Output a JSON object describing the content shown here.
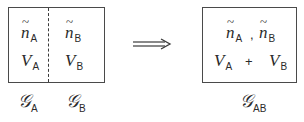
{
  "left_system": {
    "region_A": {
      "density": {
        "symbol": "n",
        "subscript": "A"
      },
      "volume": {
        "symbol": "V",
        "subscript": "A"
      },
      "label": {
        "symbol": "𝒢",
        "subscript": "A"
      }
    },
    "region_B": {
      "density": {
        "symbol": "n",
        "subscript": "B"
      },
      "volume": {
        "symbol": "V",
        "subscript": "B"
      },
      "label": {
        "symbol": "𝒢",
        "subscript": "B"
      }
    }
  },
  "arrow": {
    "type": "double-arrow",
    "direction": "right"
  },
  "right_system": {
    "density_A": {
      "symbol": "n",
      "subscript": "A"
    },
    "separator": ",",
    "density_B": {
      "symbol": "n",
      "subscript": "B"
    },
    "volume_A": {
      "symbol": "V",
      "subscript": "A"
    },
    "operator": "+",
    "volume_B": {
      "symbol": "V",
      "subscript": "B"
    },
    "label": {
      "symbol": "𝒢",
      "subscript": "AB"
    }
  }
}
